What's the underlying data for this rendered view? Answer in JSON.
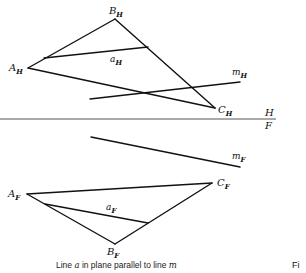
{
  "diagram": {
    "title": "Line a in plane parallel to line m",
    "caption_parts": {
      "pre": "Line ",
      "a": "a",
      "mid": " in plane parallel to line ",
      "m": "m"
    },
    "figure_ref": "Fi",
    "fold_line": {
      "upper": "H",
      "lower": "F"
    },
    "horizontal_view": {
      "points": {
        "A": {
          "base": "A",
          "sub": "H"
        },
        "B": {
          "base": "B",
          "sub": "H"
        },
        "C": {
          "base": "C",
          "sub": "H"
        }
      },
      "line_a": {
        "base": "a",
        "sub": "H"
      },
      "line_m": {
        "base": "m",
        "sub": "H"
      }
    },
    "frontal_view": {
      "points": {
        "A": {
          "base": "A",
          "sub": "F"
        },
        "B": {
          "base": "B",
          "sub": "F"
        },
        "C": {
          "base": "C",
          "sub": "F"
        }
      },
      "line_a": {
        "base": "a",
        "sub": "F"
      },
      "line_m": {
        "base": "m",
        "sub": "F"
      }
    }
  }
}
